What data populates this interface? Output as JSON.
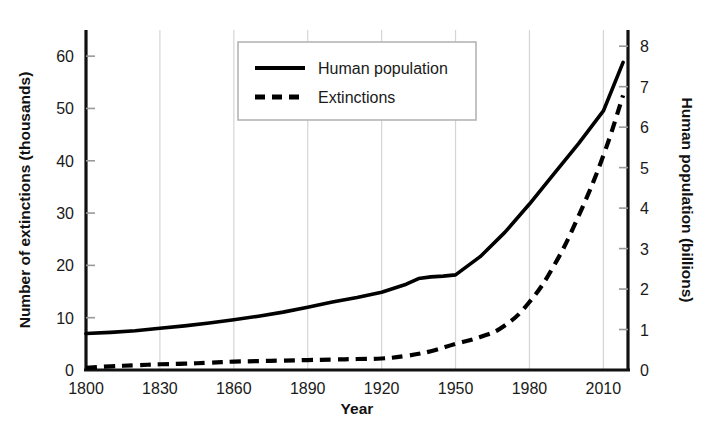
{
  "chart_data": {
    "type": "line",
    "title": "",
    "xlabel": "Year",
    "ylabel": "Number of extinctions (thousands)",
    "y2label": "Human population (billions)",
    "xlim": [
      1800,
      2020
    ],
    "ylim": [
      0,
      65
    ],
    "y2lim": [
      0,
      8.4
    ],
    "grid": "vertical-only",
    "legend_position": "top-center",
    "x_ticks": [
      "1800",
      "1830",
      "1860",
      "1890",
      "1920",
      "1950",
      "1980",
      "2010"
    ],
    "x_tick_values": [
      1800,
      1830,
      1860,
      1890,
      1920,
      1950,
      1980,
      2010
    ],
    "y_ticks": [
      "0",
      "10",
      "20",
      "30",
      "40",
      "50",
      "60"
    ],
    "y_tick_values": [
      0,
      10,
      20,
      30,
      40,
      50,
      60
    ],
    "y2_ticks": [
      "0",
      "1",
      "2",
      "3",
      "4",
      "5",
      "6",
      "7",
      "8"
    ],
    "y2_tick_values": [
      0,
      1,
      2,
      3,
      4,
      5,
      6,
      7,
      8
    ],
    "series": [
      {
        "name": "Human population",
        "axis": "right",
        "units": "billions",
        "style": "solid",
        "color": "#000000",
        "x": [
          1800,
          1810,
          1820,
          1830,
          1840,
          1850,
          1860,
          1870,
          1880,
          1890,
          1900,
          1910,
          1920,
          1930,
          1935,
          1940,
          1945,
          1950,
          1960,
          1970,
          1980,
          1990,
          2000,
          2010,
          2018
        ],
        "values": [
          0.9,
          0.93,
          0.97,
          1.03,
          1.09,
          1.16,
          1.24,
          1.33,
          1.43,
          1.55,
          1.68,
          1.79,
          1.92,
          2.12,
          2.26,
          2.3,
          2.32,
          2.35,
          2.8,
          3.4,
          4.1,
          4.85,
          5.6,
          6.4,
          7.6
        ]
      },
      {
        "name": "Extinctions",
        "axis": "left",
        "units": "thousands",
        "style": "dashed",
        "color": "#000000",
        "x": [
          1800,
          1810,
          1820,
          1830,
          1840,
          1850,
          1860,
          1870,
          1880,
          1890,
          1900,
          1910,
          1920,
          1930,
          1940,
          1950,
          1960,
          1970,
          1980,
          1990,
          2000,
          2010,
          2018
        ],
        "values": [
          0.4,
          0.7,
          0.9,
          1.1,
          1.2,
          1.4,
          1.6,
          1.7,
          1.8,
          1.9,
          2.0,
          2.1,
          2.2,
          2.7,
          3.6,
          5.0,
          6.3,
          8.5,
          13.0,
          20.0,
          29.5,
          41.0,
          52.5
        ]
      }
    ],
    "annotations": []
  },
  "axes": {
    "left_title": "Number of extinctions (thousands)",
    "right_title": "Human population (billions)",
    "bottom_title": "Year"
  },
  "legend": {
    "items": [
      {
        "label": "Human population",
        "style": "solid"
      },
      {
        "label": "Extinctions",
        "style": "dashed"
      }
    ]
  },
  "colors": {
    "line": "#000000",
    "grid": "#d5d5d5",
    "axis": "#111111",
    "legend_border": "#b5b5b5",
    "background": "#ffffff",
    "text": "#1a1a1a"
  }
}
